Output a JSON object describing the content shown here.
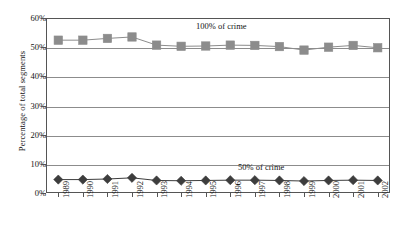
{
  "chart_data": {
    "type": "line",
    "title": "",
    "xlabel": "",
    "ylabel": "Percentage of total segments",
    "ylim": [
      0,
      60
    ],
    "ytick_labels": [
      "60%",
      "50%",
      "40%",
      "30%",
      "20%",
      "10%",
      "0%"
    ],
    "ytick_values": [
      60,
      50,
      40,
      30,
      20,
      10,
      0
    ],
    "grid": true,
    "legend_position": "inline-annotation",
    "categories": [
      "1989",
      "1990",
      "1991",
      "1992",
      "1993",
      "1994",
      "1995",
      "1996",
      "1997",
      "1998",
      "1999",
      "2000",
      "2001",
      "2002"
    ],
    "series": [
      {
        "name": "100% of crime",
        "marker": "square",
        "color": "#8c8c8c",
        "values": [
          52.4,
          52.4,
          53.0,
          53.5,
          50.7,
          50.3,
          50.4,
          50.7,
          50.6,
          50.2,
          49.0,
          50.0,
          50.6,
          49.8
        ]
      },
      {
        "name": "50% of crime",
        "marker": "diamond",
        "color": "#3d3d3d",
        "values": [
          4.6,
          4.6,
          4.8,
          5.2,
          4.3,
          4.2,
          4.3,
          4.4,
          4.4,
          4.3,
          4.1,
          4.3,
          4.4,
          4.3
        ]
      }
    ],
    "annotations": [
      {
        "text": "100% of crime",
        "series": "100% of crime"
      },
      {
        "text": "50% of crime",
        "series": "50% of crime"
      }
    ]
  },
  "colors": {
    "series_upper": "#8c8c8c",
    "series_lower": "#3d3d3d",
    "gridline": "#8c8c8c",
    "axis": "#555555",
    "text": "#141414",
    "background": "#ffffff"
  }
}
